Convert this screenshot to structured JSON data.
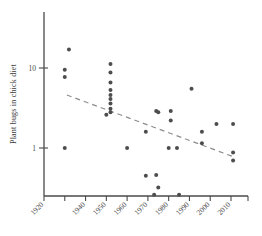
{
  "chart_data": {
    "type": "scatter",
    "title": "",
    "subtitle": "",
    "xlabel": "",
    "ylabel": "Plant bugs in chick diet",
    "yscale": "log",
    "xlim": [
      1920,
      2014
    ],
    "ylim": [
      0.22,
      26
    ],
    "grid": false,
    "legend": null,
    "xticks": [
      1920,
      1930,
      1940,
      1950,
      1960,
      1970,
      1980,
      1990,
      2000,
      2010
    ],
    "xticklabels": [
      "1920",
      "1940",
      "1950",
      "1960",
      "1970",
      "1980",
      "1990",
      "2000",
      "2010"
    ],
    "xticklabels_shown": [
      "1920",
      "1940",
      "1950",
      "1960",
      "1970",
      "1980",
      "1990",
      "2000",
      "2010"
    ],
    "yticks": [
      1,
      10
    ],
    "yticklabels": [
      "1",
      "10"
    ],
    "marker": "circle",
    "marker_color": "#4d4d4d",
    "trendline": {
      "style": "dashed",
      "color": "#8d8d8d",
      "x_start": 1931,
      "y_start": 4.6,
      "x_end": 2011,
      "y_end": 0.78
    },
    "points": [
      {
        "x": 1932,
        "y": 17.0
      },
      {
        "x": 1930,
        "y": 9.5
      },
      {
        "x": 1930,
        "y": 7.7
      },
      {
        "x": 1930,
        "y": 1.0
      },
      {
        "x": 1952,
        "y": 11.2
      },
      {
        "x": 1952,
        "y": 8.8
      },
      {
        "x": 1952,
        "y": 6.6
      },
      {
        "x": 1952,
        "y": 5.3
      },
      {
        "x": 1952,
        "y": 4.6
      },
      {
        "x": 1952,
        "y": 4.1
      },
      {
        "x": 1952,
        "y": 3.6
      },
      {
        "x": 1952,
        "y": 3.1
      },
      {
        "x": 1952,
        "y": 2.8
      },
      {
        "x": 1950,
        "y": 2.6
      },
      {
        "x": 1960,
        "y": 1.0
      },
      {
        "x": 1969,
        "y": 1.6
      },
      {
        "x": 1969,
        "y": 0.45
      },
      {
        "x": 1974,
        "y": 2.9
      },
      {
        "x": 1975,
        "y": 2.8
      },
      {
        "x": 1974,
        "y": 0.46
      },
      {
        "x": 1975,
        "y": 0.32
      },
      {
        "x": 1973,
        "y": 0.26
      },
      {
        "x": 1981,
        "y": 2.9
      },
      {
        "x": 1981,
        "y": 2.2
      },
      {
        "x": 1980,
        "y": 1.0
      },
      {
        "x": 1984,
        "y": 1.0
      },
      {
        "x": 1985,
        "y": 0.26
      },
      {
        "x": 1991,
        "y": 5.5
      },
      {
        "x": 1996,
        "y": 1.6
      },
      {
        "x": 1996,
        "y": 1.15
      },
      {
        "x": 2003,
        "y": 2.0
      },
      {
        "x": 2011,
        "y": 2.0
      },
      {
        "x": 2011,
        "y": 0.88
      },
      {
        "x": 2011,
        "y": 0.7
      }
    ]
  }
}
